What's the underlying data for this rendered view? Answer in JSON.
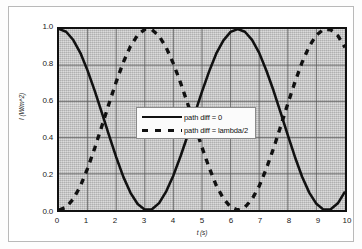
{
  "chart_data": {
    "type": "line",
    "title": "",
    "xlabel": "t (s)",
    "ylabel": "I (W/m^2)",
    "xlim": [
      0,
      10
    ],
    "ylim": [
      0,
      1
    ],
    "grid": true,
    "legend_position": "center",
    "x_ticks": [
      "0",
      "1",
      "2",
      "3",
      "4",
      "5",
      "6",
      "7",
      "8",
      "9",
      "10"
    ],
    "y_ticks": [
      "0.0",
      "0.2",
      "0.4",
      "0.6",
      "0.8",
      "1.0"
    ],
    "series": [
      {
        "name": "path diff = 0",
        "style": "solid",
        "color": "#111111",
        "formula": "cos(x/2)^2",
        "x": [
          0.0,
          0.25,
          0.5,
          0.75,
          1.0,
          1.25,
          1.5,
          1.75,
          2.0,
          2.25,
          2.5,
          2.75,
          3.0,
          3.25,
          3.5,
          3.75,
          4.0,
          4.25,
          4.5,
          4.75,
          5.0,
          5.25,
          5.5,
          5.75,
          6.0,
          6.25,
          6.5,
          6.75,
          7.0,
          7.25,
          7.5,
          7.75,
          8.0,
          8.25,
          8.5,
          8.75,
          9.0,
          9.25,
          9.5,
          9.75,
          10.0
        ],
        "values": [
          1.0,
          0.985,
          0.939,
          0.867,
          0.77,
          0.658,
          0.536,
          0.412,
          0.292,
          0.183,
          0.095,
          0.033,
          0.002,
          0.004,
          0.038,
          0.103,
          0.191,
          0.297,
          0.413,
          0.534,
          0.654,
          0.766,
          0.865,
          0.937,
          0.984,
          1.0,
          0.985,
          0.94,
          0.868,
          0.771,
          0.66,
          0.538,
          0.413,
          0.293,
          0.184,
          0.096,
          0.034,
          0.002,
          0.004,
          0.037,
          0.102
        ]
      },
      {
        "name": "path diff = lambda/2",
        "style": "dashed",
        "color": "#111111",
        "formula": "sin(x/2)^2",
        "x": [
          0.0,
          0.25,
          0.5,
          0.75,
          1.0,
          1.25,
          1.5,
          1.75,
          2.0,
          2.25,
          2.5,
          2.75,
          3.0,
          3.25,
          3.5,
          3.75,
          4.0,
          4.25,
          4.5,
          4.75,
          5.0,
          5.25,
          5.5,
          5.75,
          6.0,
          6.25,
          6.5,
          6.75,
          7.0,
          7.25,
          7.5,
          7.75,
          8.0,
          8.25,
          8.5,
          8.75,
          9.0,
          9.25,
          9.5,
          9.75,
          10.0
        ],
        "values": [
          0.0,
          0.015,
          0.061,
          0.133,
          0.23,
          0.342,
          0.464,
          0.588,
          0.708,
          0.817,
          0.905,
          0.967,
          0.998,
          0.996,
          0.962,
          0.897,
          0.809,
          0.703,
          0.587,
          0.466,
          0.346,
          0.234,
          0.135,
          0.063,
          0.016,
          0.0,
          0.015,
          0.06,
          0.132,
          0.229,
          0.34,
          0.462,
          0.587,
          0.707,
          0.816,
          0.904,
          0.966,
          0.998,
          0.996,
          0.963,
          0.898
        ]
      }
    ]
  }
}
